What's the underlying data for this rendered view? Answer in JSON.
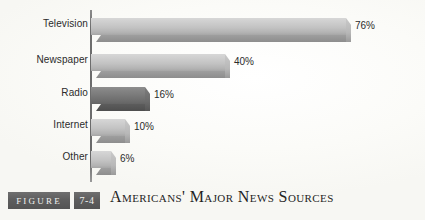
{
  "caption": {
    "figure_tag": "FIGURE",
    "figure_number": "7-4",
    "title": "Americans' Major News Sources"
  },
  "colors": {
    "bar_light": "#c3c3c3",
    "bar_dark": "#777777",
    "axis": "#6a6a6a",
    "text": "#2b2b2b",
    "tag_background": "#5e5e5e",
    "tag_text": "#f2f2f0",
    "page_background": "#fdfdfb"
  },
  "chart_data": {
    "type": "bar",
    "orientation": "horizontal",
    "title": "Americans' Major News Sources",
    "xlabel": "",
    "ylabel": "",
    "xlim": [
      0,
      85
    ],
    "grid": false,
    "legend": null,
    "value_suffix": "%",
    "categories": [
      "Television",
      "Newspaper",
      "Radio",
      "Internet",
      "Other"
    ],
    "values": [
      76,
      40,
      16,
      10,
      6
    ],
    "value_labels": [
      "76%",
      "40%",
      "16%",
      "10%",
      "6%"
    ],
    "highlighted_category": "Radio",
    "bars": [
      {
        "category": "Television",
        "value": 76,
        "label": "76%",
        "shade": "light"
      },
      {
        "category": "Newspaper",
        "value": 40,
        "label": "40%",
        "shade": "light"
      },
      {
        "category": "Radio",
        "value": 16,
        "label": "16%",
        "shade": "dark"
      },
      {
        "category": "Internet",
        "value": 10,
        "label": "10%",
        "shade": "light"
      },
      {
        "category": "Other",
        "value": 6,
        "label": "6%",
        "shade": "light"
      }
    ]
  }
}
